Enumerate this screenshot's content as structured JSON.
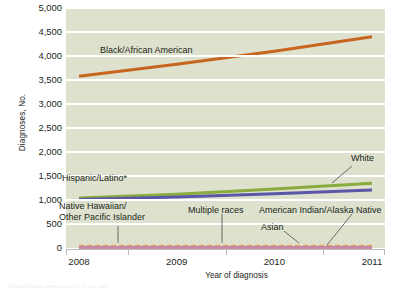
{
  "chart_data": {
    "type": "line",
    "title": "",
    "xlabel": "Year of diagnosis",
    "ylabel": "Diagnoses, No.",
    "x": [
      2008,
      2009,
      2010,
      2011
    ],
    "xticklabels": [
      "2008",
      "2009",
      "2010",
      "2011"
    ],
    "ylim": [
      0,
      5000
    ],
    "yticks": [
      0,
      500,
      1000,
      1500,
      2000,
      2500,
      3000,
      3500,
      4000,
      4500,
      5000
    ],
    "yticklabels": [
      "0",
      "500",
      "1,000",
      "1,500",
      "2,000",
      "2,500",
      "3,000",
      "3,500",
      "4,000",
      "4,500",
      "5,000"
    ],
    "grid": true,
    "legend_position": "inline-annotations",
    "plot_background": "#dde1ce",
    "gridline_color": "#ffffff",
    "series": [
      {
        "name": "Black/African American",
        "color": "#c8651f",
        "style": "solid",
        "values": [
          3580,
          3830,
          4100,
          4400
        ]
      },
      {
        "name": "White",
        "color": "#8aab3d",
        "style": "solid",
        "values": [
          1040,
          1120,
          1230,
          1350
        ]
      },
      {
        "name": "Hispanic/Latino*",
        "color": "#5b56a6",
        "style": "solid",
        "values": [
          1010,
          1060,
          1130,
          1210
        ]
      },
      {
        "name": "Native Hawaiian/Other Pacific Islander",
        "color": "#e8a33d",
        "style": "dashed",
        "values": [
          25,
          25,
          25,
          25
        ]
      },
      {
        "name": "Multiple races",
        "color": "#d9c9a0",
        "style": "solid",
        "values": [
          15,
          15,
          15,
          15
        ]
      },
      {
        "name": "American Indian/Alaska Native",
        "color": "#b05f86",
        "style": "solid",
        "values": [
          10,
          10,
          10,
          10
        ]
      },
      {
        "name": "Asian",
        "color": "#c98bb4",
        "style": "solid",
        "values": [
          5,
          5,
          5,
          5
        ]
      }
    ],
    "annotations": [
      {
        "id": "black-african-american",
        "text": "Black/African American",
        "x": 100,
        "y": 45,
        "align": "left",
        "leader": null
      },
      {
        "id": "white",
        "text": "White",
        "x": 351,
        "y": 153,
        "align": "left",
        "leader": {
          "x1": 352,
          "y1": 166,
          "x2": 332,
          "y2": 183
        }
      },
      {
        "id": "hispanic-latino",
        "text": "Hispanic/Latino*",
        "x": 62,
        "y": 173,
        "align": "left",
        "leader": null
      },
      {
        "id": "native-hawaiian",
        "line1": "Native Hawaiian/",
        "line2": "Other Pacific Islander",
        "x": 59,
        "y": 201,
        "align": "left",
        "leader": {
          "x1": 118,
          "y1": 226,
          "x2": 118,
          "y2": 243
        }
      },
      {
        "id": "multiple-races",
        "text": "Multiple races",
        "x": 188,
        "y": 205,
        "align": "left",
        "leader": {
          "x1": 222,
          "y1": 214,
          "x2": 222,
          "y2": 243
        }
      },
      {
        "id": "american-indian-alaska-native",
        "text": "American Indian/Alaska Native",
        "x": 259,
        "y": 205,
        "align": "left",
        "leader": {
          "x1": 352,
          "y1": 214,
          "x2": 327,
          "y2": 245
        }
      },
      {
        "id": "asian",
        "text": "Asian",
        "x": 261,
        "y": 222,
        "align": "left",
        "leader": {
          "x1": 284,
          "y1": 231,
          "x2": 299,
          "y2": 243
        }
      }
    ],
    "footnote": "*Hispanic/Latino persons can be of any race."
  }
}
